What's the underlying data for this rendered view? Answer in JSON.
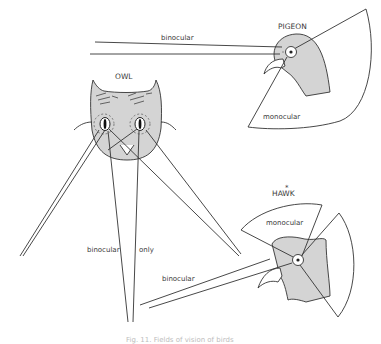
{
  "figure": {
    "caption": "Fig. 11.  Fields of vision of birds",
    "subjects": [
      {
        "name": "PIGEON",
        "labels": {
          "binocular": "binocular",
          "monocular": "monocular"
        }
      },
      {
        "name": "OWL",
        "labels": {
          "binocular": "binocular",
          "only": "only"
        }
      },
      {
        "name": "HAWK",
        "labels": {
          "monocular": "monocular",
          "binocular": "binocular"
        },
        "marker": "*"
      }
    ]
  },
  "colors": {
    "head_fill": "#d4d4d4",
    "line": "#333333",
    "background": "#ffffff"
  }
}
